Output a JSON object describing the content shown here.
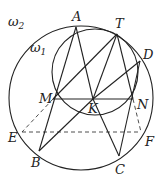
{
  "diagram": {
    "type": "geometry",
    "circles": [
      {
        "name": "ω2",
        "label": "ω",
        "sub": "2",
        "cx": 81,
        "cy": 98,
        "r": 72
      },
      {
        "name": "ω1",
        "label": "ω",
        "sub": "1",
        "cx": 95,
        "cy": 72,
        "r": 43
      }
    ],
    "points": {
      "A": {
        "label": "A",
        "x": 76,
        "y": 27
      },
      "T": {
        "label": "T",
        "x": 117,
        "y": 34
      },
      "D": {
        "label": "D",
        "x": 140,
        "y": 61
      },
      "M": {
        "label": "M",
        "x": 53,
        "y": 99
      },
      "K": {
        "label": "K",
        "x": 93,
        "y": 99
      },
      "N": {
        "label": "N",
        "x": 133,
        "y": 99
      },
      "E": {
        "label": "E",
        "x": 22,
        "y": 132
      },
      "F": {
        "label": "F",
        "x": 141,
        "y": 132
      },
      "B": {
        "label": "B",
        "x": 39,
        "y": 151
      },
      "C": {
        "label": "C",
        "x": 119,
        "y": 156
      }
    },
    "segments_solid": [
      [
        "A",
        "B"
      ],
      [
        "A",
        "K"
      ],
      [
        "M",
        "T"
      ],
      [
        "T",
        "K"
      ],
      [
        "T",
        "N"
      ],
      [
        "K",
        "D"
      ],
      [
        "K",
        "B"
      ],
      [
        "K",
        "C"
      ],
      [
        "D",
        "C"
      ],
      [
        "M",
        "N"
      ]
    ],
    "segments_dashed": [
      [
        "E",
        "F"
      ],
      [
        "M",
        "E"
      ],
      [
        "N",
        "F"
      ]
    ]
  }
}
